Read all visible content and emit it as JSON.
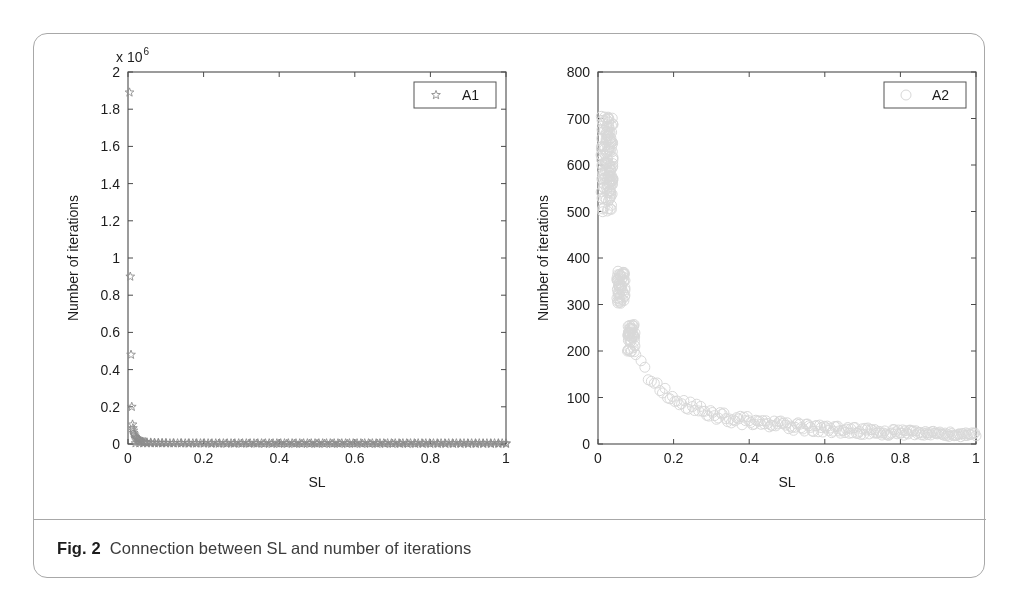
{
  "figure": {
    "caption_label": "Fig. 2",
    "caption_text": "Connection between SL and number of iterations",
    "border_color": "#a8a8a8",
    "background": "#ffffff"
  },
  "chart_data": [
    {
      "id": "A1",
      "type": "scatter",
      "title": "",
      "xlabel": "SL",
      "ylabel": "Number of iterations",
      "y_multiplier_text": "x 10",
      "y_multiplier_exponent": "6",
      "y_scale": 1000000,
      "xlim": [
        0,
        1
      ],
      "ylim": [
        0,
        2
      ],
      "xticks": [
        0,
        0.2,
        0.4,
        0.6,
        0.8,
        1
      ],
      "xticklabels": [
        "0",
        "0.2",
        "0.4",
        "0.6",
        "0.8",
        "1"
      ],
      "yticks": [
        0,
        0.2,
        0.4,
        0.6,
        0.8,
        1,
        1.2,
        1.4,
        1.6,
        1.8,
        2
      ],
      "yticklabels": [
        "0",
        "0.2",
        "0.4",
        "0.6",
        "0.8",
        "1",
        "1.2",
        "1.4",
        "1.6",
        "1.8",
        "2"
      ],
      "grid": false,
      "legend": {
        "label": "A1",
        "marker": "star",
        "position": "top-right"
      },
      "marker": {
        "shape": "star",
        "color": "#8c8c8c",
        "size": 4.6,
        "filled": false
      },
      "axis_color": "#4a4a4a",
      "points": [
        [
          0.004,
          1.89
        ],
        [
          0.006,
          0.9
        ],
        [
          0.008,
          0.48
        ],
        [
          0.01,
          0.2
        ],
        [
          0.012,
          0.105
        ],
        [
          0.013,
          0.085
        ],
        [
          0.014,
          0.072
        ],
        [
          0.015,
          0.06
        ],
        [
          0.016,
          0.052
        ],
        [
          0.018,
          0.045
        ],
        [
          0.02,
          0.038
        ],
        [
          0.022,
          0.032
        ],
        [
          0.024,
          0.028
        ],
        [
          0.026,
          0.024
        ],
        [
          0.028,
          0.021
        ],
        [
          0.03,
          0.018
        ],
        [
          0.034,
          0.015
        ],
        [
          0.038,
          0.013
        ],
        [
          0.042,
          0.011
        ],
        [
          0.046,
          0.01
        ],
        [
          0.05,
          0.009
        ],
        [
          0.06,
          0.008
        ],
        [
          0.07,
          0.007
        ],
        [
          0.08,
          0.006
        ],
        [
          0.09,
          0.005
        ],
        [
          0.1,
          0.005
        ],
        [
          0.12,
          0.004
        ],
        [
          0.14,
          0.004
        ],
        [
          0.16,
          0.003
        ],
        [
          0.18,
          0.003
        ],
        [
          0.2,
          0.003
        ],
        [
          0.22,
          0.002
        ],
        [
          0.24,
          0.002
        ],
        [
          0.26,
          0.002
        ],
        [
          0.28,
          0.002
        ],
        [
          0.3,
          0.002
        ],
        [
          0.32,
          0.002
        ],
        [
          0.34,
          0.002
        ],
        [
          0.36,
          0.001
        ],
        [
          0.38,
          0.001
        ],
        [
          0.4,
          0.001
        ],
        [
          0.42,
          0.001
        ],
        [
          0.44,
          0.001
        ],
        [
          0.46,
          0.001
        ],
        [
          0.48,
          0.001
        ],
        [
          0.5,
          0.001
        ],
        [
          0.52,
          0.001
        ],
        [
          0.54,
          0.001
        ],
        [
          0.56,
          0.001
        ],
        [
          0.58,
          0.001
        ],
        [
          0.6,
          0.001
        ],
        [
          0.62,
          0.001
        ],
        [
          0.64,
          0.001
        ],
        [
          0.66,
          0.001
        ],
        [
          0.68,
          0.001
        ],
        [
          0.7,
          0.001
        ],
        [
          0.72,
          0.001
        ],
        [
          0.74,
          0.001
        ],
        [
          0.76,
          0.001
        ],
        [
          0.78,
          0.001
        ],
        [
          0.8,
          0.001
        ],
        [
          0.82,
          0.001
        ],
        [
          0.84,
          0.001
        ],
        [
          0.86,
          0.001
        ],
        [
          0.88,
          0.001
        ],
        [
          0.9,
          0.001
        ],
        [
          0.92,
          0.001
        ],
        [
          0.94,
          0.001
        ],
        [
          0.96,
          0.001
        ],
        [
          0.98,
          0.001
        ],
        [
          1.0,
          0.001
        ]
      ],
      "dense_baseline": {
        "description": "dense row of star markers along y=0 from x=0.02 to x=1.0",
        "x_start": 0.02,
        "x_end": 1.0,
        "count": 98,
        "y": 0.004
      }
    },
    {
      "id": "A2",
      "type": "scatter",
      "title": "",
      "xlabel": "SL",
      "ylabel": "Number of iterations",
      "xlim": [
        0,
        1
      ],
      "ylim": [
        0,
        800
      ],
      "xticks": [
        0,
        0.2,
        0.4,
        0.6,
        0.8,
        1
      ],
      "xticklabels": [
        "0",
        "0.2",
        "0.4",
        "0.6",
        "0.8",
        "1"
      ],
      "yticks": [
        0,
        100,
        200,
        300,
        400,
        500,
        600,
        700,
        800
      ],
      "yticklabels": [
        "0",
        "100",
        "200",
        "300",
        "400",
        "500",
        "600",
        "700",
        "800"
      ],
      "grid": false,
      "legend": {
        "label": "A2",
        "marker": "circle",
        "position": "top-right"
      },
      "marker": {
        "shape": "circle",
        "color": "#d8d8d8",
        "size": 5.0,
        "filled": false
      },
      "axis_color": "#4a4a4a",
      "clusters": [
        {
          "x_min": 0.008,
          "x_max": 0.04,
          "y_min": 498,
          "y_max": 706,
          "count": 150
        },
        {
          "x_min": 0.05,
          "x_max": 0.072,
          "y_min": 298,
          "y_max": 372,
          "count": 55
        },
        {
          "x_min": 0.078,
          "x_max": 0.098,
          "y_min": 198,
          "y_max": 258,
          "count": 45
        }
      ],
      "decay_curve": {
        "description": "hyperbolic decay band of open circles",
        "x_start": 0.1,
        "x_end": 1.0,
        "count": 210,
        "formula": "y = 19.5 / x",
        "spread": 9
      },
      "reference_points": [
        [
          0.1,
          195
        ],
        [
          0.12,
          163
        ],
        [
          0.15,
          130
        ],
        [
          0.18,
          108
        ],
        [
          0.2,
          98
        ],
        [
          0.25,
          78
        ],
        [
          0.3,
          65
        ],
        [
          0.35,
          56
        ],
        [
          0.4,
          49
        ],
        [
          0.45,
          43
        ],
        [
          0.5,
          39
        ],
        [
          0.55,
          35
        ],
        [
          0.6,
          32
        ],
        [
          0.65,
          30
        ],
        [
          0.7,
          28
        ],
        [
          0.75,
          26
        ],
        [
          0.8,
          24
        ],
        [
          0.85,
          23
        ],
        [
          0.9,
          21
        ],
        [
          0.95,
          20
        ],
        [
          1.0,
          19
        ]
      ]
    }
  ]
}
